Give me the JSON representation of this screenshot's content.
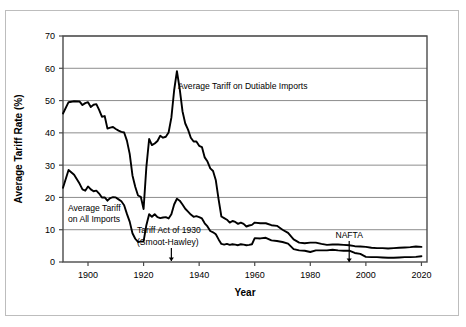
{
  "chart_data": {
    "type": "line",
    "title": "",
    "xlabel": "Year",
    "ylabel": "Average Tariff Rate (%)",
    "xlim": [
      1891,
      2022
    ],
    "ylim": [
      0,
      70
    ],
    "xticks": [
      1900,
      1920,
      1940,
      1960,
      1980,
      2000,
      2020
    ],
    "xtick_labels": [
      "1900",
      "1920",
      "1940",
      "1960",
      "1980",
      "2000",
      "2020"
    ],
    "yticks": [
      0,
      10,
      20,
      30,
      40,
      50,
      60,
      70
    ],
    "ytick_labels": [
      "0",
      "10",
      "20",
      "30",
      "40",
      "50",
      "60",
      "70"
    ],
    "grid": "horizontal",
    "legend": "none (inline labels)",
    "series": [
      {
        "name": "Average Tariff on Dutiable Imports",
        "color": "#000000",
        "x": [
          1891,
          1893,
          1895,
          1897,
          1898,
          1899,
          1900,
          1901,
          1902,
          1903,
          1904,
          1905,
          1906,
          1907,
          1908,
          1909,
          1910,
          1911,
          1912,
          1913,
          1914,
          1915,
          1916,
          1917,
          1918,
          1919,
          1920,
          1921,
          1922,
          1923,
          1924,
          1925,
          1926,
          1927,
          1928,
          1929,
          1930,
          1931,
          1932,
          1933,
          1934,
          1935,
          1936,
          1937,
          1938,
          1939,
          1940,
          1941,
          1942,
          1943,
          1944,
          1945,
          1946,
          1947,
          1948,
          1949,
          1950,
          1951,
          1952,
          1953,
          1954,
          1955,
          1956,
          1957,
          1958,
          1959,
          1960,
          1962,
          1964,
          1966,
          1968,
          1970,
          1972,
          1974,
          1976,
          1978,
          1980,
          1982,
          1984,
          1986,
          1988,
          1990,
          1992,
          1994,
          1996,
          1998,
          2000,
          2002,
          2004,
          2006,
          2008,
          2010,
          2012,
          2014,
          2016,
          2018,
          2020
        ],
        "y": [
          46.0,
          49.5,
          49.8,
          49.7,
          48.6,
          49.2,
          49.5,
          48.0,
          48.7,
          48.9,
          47.1,
          45.0,
          45.2,
          41.3,
          41.6,
          41.8,
          41.2,
          40.7,
          40.3,
          40.1,
          37.6,
          33.5,
          26.8,
          23.3,
          20.6,
          20.2,
          16.4,
          29.4,
          38.1,
          36.2,
          36.7,
          37.5,
          39.1,
          38.5,
          38.8,
          40.1,
          44.7,
          53.2,
          59.1,
          53.6,
          46.7,
          42.9,
          41.0,
          38.5,
          37.3,
          37.3,
          36.0,
          35.6,
          32.4,
          31.1,
          29.0,
          28.2,
          25.3,
          19.4,
          14.1,
          13.6,
          13.1,
          12.2,
          12.7,
          12.4,
          11.8,
          12.2,
          11.8,
          11.0,
          11.3,
          11.5,
          12.2,
          12.0,
          12.0,
          11.4,
          11.2,
          10.0,
          9.0,
          7.0,
          6.0,
          5.8,
          6.0,
          6.0,
          5.6,
          5.3,
          5.4,
          5.4,
          5.3,
          5.2,
          4.9,
          4.8,
          4.7,
          4.4,
          4.3,
          4.3,
          4.2,
          4.3,
          4.4,
          4.5,
          4.6,
          4.8,
          4.7
        ]
      },
      {
        "name": "Average Tariff on All Imports",
        "color": "#000000",
        "x": [
          1891,
          1893,
          1895,
          1897,
          1898,
          1899,
          1900,
          1901,
          1902,
          1903,
          1904,
          1905,
          1906,
          1907,
          1908,
          1909,
          1910,
          1911,
          1912,
          1913,
          1914,
          1915,
          1916,
          1917,
          1918,
          1919,
          1920,
          1921,
          1922,
          1923,
          1924,
          1925,
          1926,
          1927,
          1928,
          1929,
          1930,
          1931,
          1932,
          1933,
          1934,
          1935,
          1936,
          1937,
          1938,
          1939,
          1940,
          1941,
          1942,
          1943,
          1944,
          1945,
          1946,
          1947,
          1948,
          1949,
          1950,
          1951,
          1952,
          1953,
          1954,
          1955,
          1956,
          1957,
          1958,
          1959,
          1960,
          1962,
          1964,
          1966,
          1968,
          1970,
          1972,
          1974,
          1976,
          1978,
          1980,
          1982,
          1984,
          1986,
          1988,
          1990,
          1992,
          1994,
          1996,
          1998,
          2000,
          2002,
          2004,
          2006,
          2008,
          2010,
          2012,
          2014,
          2016,
          2018,
          2020
        ],
        "y": [
          23.0,
          28.5,
          27.0,
          24.2,
          22.5,
          22.1,
          23.4,
          22.5,
          21.9,
          22.1,
          21.2,
          20.0,
          20.0,
          19.0,
          19.8,
          20.1,
          20.0,
          19.4,
          18.8,
          17.6,
          14.9,
          12.5,
          8.9,
          7.2,
          6.2,
          6.3,
          6.4,
          11.4,
          14.8,
          14.0,
          14.8,
          13.9,
          13.6,
          13.8,
          13.9,
          13.5,
          14.8,
          17.8,
          19.6,
          19.0,
          17.8,
          16.5,
          15.6,
          14.7,
          14.0,
          14.2,
          13.9,
          13.5,
          12.0,
          11.0,
          9.6,
          9.2,
          8.6,
          7.0,
          5.6,
          5.4,
          5.6,
          5.3,
          5.5,
          5.4,
          5.2,
          5.5,
          5.4,
          5.2,
          5.3,
          5.5,
          7.4,
          7.3,
          7.5,
          6.7,
          6.5,
          6.2,
          5.7,
          4.0,
          3.6,
          3.5,
          3.1,
          3.6,
          3.6,
          3.6,
          3.8,
          3.6,
          3.5,
          3.5,
          2.8,
          2.5,
          1.6,
          1.5,
          1.5,
          1.4,
          1.3,
          1.3,
          1.4,
          1.5,
          1.5,
          1.6,
          1.8
        ]
      }
    ],
    "annotations": [
      {
        "name": "dutiable-label",
        "text": "Average Tariff on Dutiable Imports",
        "x": 1938,
        "y": 55
      },
      {
        "name": "all-imports-label",
        "line1": "Average Tariff",
        "line2": "on All Imports",
        "x": 1898,
        "y": 17
      },
      {
        "name": "smoot-hawley-label",
        "line1": "Tariff Act of 1930",
        "line2": "(Smoot-Hawley)",
        "x": 1930,
        "y": 9,
        "arrow": true
      },
      {
        "name": "nafta-label",
        "text": "NAFTA",
        "x": 1994,
        "y": 6,
        "arrow": true
      }
    ]
  },
  "colors": {
    "line": "#000000",
    "grid": "#808080",
    "axis": "#4a4a4a",
    "frame": "#bdbdbd",
    "background": "#ffffff"
  }
}
